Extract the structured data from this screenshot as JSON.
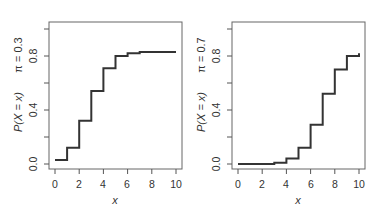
{
  "chart_data": [
    {
      "type": "line",
      "step": true,
      "title": "",
      "panel_label": "π = 0.3",
      "xlabel": "x",
      "ylabel": "P(X = x)",
      "x": [
        0,
        1,
        2,
        3,
        4,
        5,
        6,
        7,
        8,
        9,
        10
      ],
      "values": [
        0.03,
        0.12,
        0.32,
        0.54,
        0.71,
        0.8,
        0.82,
        0.83,
        0.83,
        0.83,
        0.83
      ],
      "xlim": [
        0,
        10
      ],
      "ylim": [
        0.0,
        1.0
      ],
      "xticks": [
        "0",
        "2",
        "4",
        "6",
        "8",
        "10"
      ],
      "yticks": [
        "0.0",
        "0.4",
        "0.8"
      ],
      "ytick_marks": [
        0.0,
        0.2,
        0.4,
        0.6,
        0.8,
        1.0
      ],
      "grid": false,
      "legend": null
    },
    {
      "type": "line",
      "step": true,
      "title": "",
      "panel_label": "π = 0.7",
      "xlabel": "x",
      "ylabel": "P(X = x)",
      "x": [
        0,
        1,
        2,
        3,
        4,
        5,
        6,
        7,
        8,
        9,
        10
      ],
      "values": [
        0.0,
        0.0,
        0.0,
        0.01,
        0.04,
        0.12,
        0.29,
        0.52,
        0.7,
        0.8,
        0.82
      ],
      "xlim": [
        0,
        10
      ],
      "ylim": [
        0.0,
        1.0
      ],
      "xticks": [
        "0",
        "2",
        "4",
        "6",
        "8",
        "10"
      ],
      "yticks": [
        "0.0",
        "0.4",
        "0.8"
      ],
      "ytick_marks": [
        0.0,
        0.2,
        0.4,
        0.6,
        0.8,
        1.0
      ],
      "grid": false,
      "legend": null
    }
  ],
  "panels": [
    {
      "ylabel": "P(X = x)",
      "pi_label": "π = 0.3",
      "xlabel": "x",
      "xticks": [
        "0",
        "2",
        "4",
        "6",
        "8",
        "10"
      ],
      "yticks": [
        "0.0",
        "0.4",
        "0.8"
      ]
    },
    {
      "ylabel": "P(X = x)",
      "pi_label": "π = 0.7",
      "xlabel": "x",
      "xticks": [
        "0",
        "2",
        "4",
        "6",
        "8",
        "10"
      ],
      "yticks": [
        "0.0",
        "0.4",
        "0.8"
      ]
    }
  ],
  "colors": {
    "line": "#333333",
    "frame": "#555555",
    "text": "#333333"
  }
}
